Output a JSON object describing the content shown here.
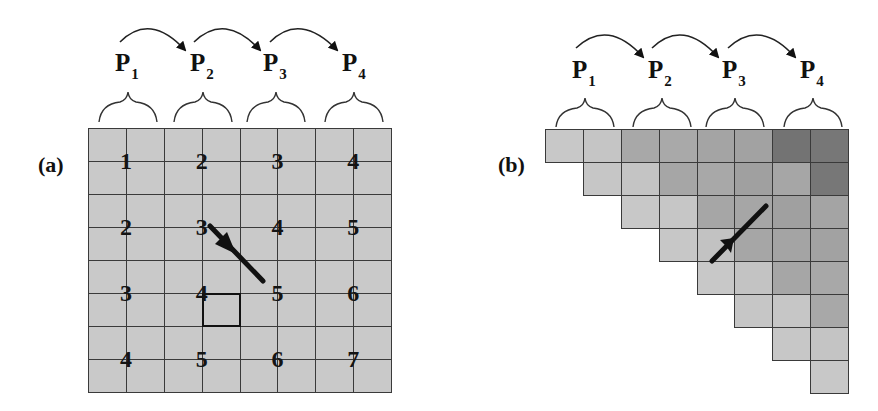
{
  "panel_a": {
    "label": "(a)",
    "processors": [
      {
        "name": "P",
        "sub": "1"
      },
      {
        "name": "P",
        "sub": "2"
      },
      {
        "name": "P",
        "sub": "3"
      },
      {
        "name": "P",
        "sub": "4"
      }
    ],
    "grid": {
      "rows": 8,
      "cols": 8,
      "fill": "#c9c9c9"
    },
    "numbers": [
      [
        1,
        2,
        3,
        4
      ],
      [
        2,
        3,
        4,
        5
      ],
      [
        3,
        4,
        5,
        6
      ],
      [
        4,
        5,
        6,
        7
      ]
    ],
    "highlighted_cell": {
      "row": 5,
      "col": 3
    }
  },
  "panel_b": {
    "label": "(b)",
    "processors": [
      {
        "name": "P",
        "sub": "1"
      },
      {
        "name": "P",
        "sub": "2"
      },
      {
        "name": "P",
        "sub": "3"
      },
      {
        "name": "P",
        "sub": "4"
      }
    ],
    "grid": {
      "rows": 8,
      "cols": 8,
      "shape": "upper-triangular"
    },
    "cell_colors": [
      [
        "#c8c8c8",
        "#c5c5c5",
        "#a8a8a8",
        "#a9a9a9",
        "#a4a4a4",
        "#a2a2a2",
        "#737373",
        "#777777"
      ],
      [
        null,
        "#c6c6c6",
        "#c4c4c4",
        "#a6a6a6",
        "#a8a8a8",
        "#a0a0a0",
        "#a6a6a6",
        "#777777"
      ],
      [
        null,
        null,
        "#c8c8c8",
        "#c6c6c6",
        "#a6a6a6",
        "#a6a6a6",
        "#a0a0a0",
        "#a4a4a4"
      ],
      [
        null,
        null,
        null,
        "#c7c7c7",
        "#c2c2c2",
        "#a6a6a6",
        "#a4a4a4",
        "#a2a2a2"
      ],
      [
        null,
        null,
        null,
        null,
        "#c8c8c8",
        "#c3c3c3",
        "#a6a6a6",
        "#a8a8a8"
      ],
      [
        null,
        null,
        null,
        null,
        null,
        "#c6c6c6",
        "#c6c6c6",
        "#a8a8a8"
      ],
      [
        null,
        null,
        null,
        null,
        null,
        null,
        "#c7c7c7",
        "#c4c4c4"
      ],
      [
        null,
        null,
        null,
        null,
        null,
        null,
        null,
        "#c8c8c8"
      ]
    ]
  }
}
